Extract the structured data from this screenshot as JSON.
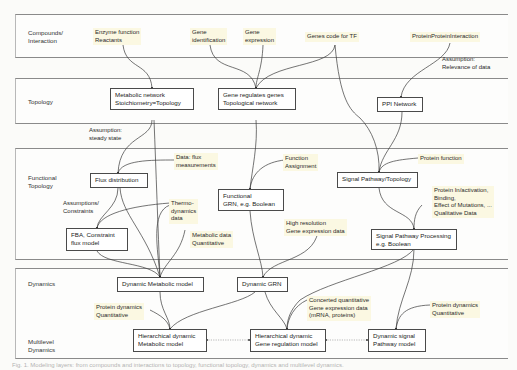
{
  "layers": [
    {
      "id": "compounds",
      "label": "Compounds/\nInteraction"
    },
    {
      "id": "topology",
      "label": "Topology"
    },
    {
      "id": "functional",
      "label": "Functional\nTopology"
    },
    {
      "id": "dynamics",
      "label": "Dynamics"
    },
    {
      "id": "multilevel",
      "label": "Multilevel\nDynamics"
    }
  ],
  "inputs": {
    "enzyme": "Enzyme function\nReactants",
    "gene_identification": "Gene\nidentification",
    "gene_expression": "Gene\nexpression",
    "genes_code_tf": "Genes code for TF",
    "ppi": "ProteinProteinInteraction"
  },
  "nodes": {
    "metabolic_network": "Metabolic network\nStoichiometry=Topology",
    "gene_regulates": "Gene regulates genes\nTopological network",
    "ppi_network": "PPI Network",
    "flux_distribution": "Flux distribution",
    "functional_grn": "Functional\nGRN, e.g. Boolean",
    "signal_topology": "Signal Pathway/Topology",
    "fba": "FBA, Constraint\nflux model",
    "signal_processing": "Signal Pathway Processing\ne.g. Boolean",
    "dynamic_metabolic": "Dynamic Metabolic model",
    "dynamic_grn": "Dynamic GRN",
    "hier_metabolic": "Hierarchical dynamic\nMetabolic model",
    "hier_gene": "Hierarchical dynamic\nGene regulation model",
    "dynamic_signal": "Dynamic signal\nPathway model"
  },
  "annotations": {
    "assumption_relevance": "Assumption:\nRelevance of data",
    "assumption_steady": "Assumption:\nsteady state",
    "data_flux": "Data: flux\nmeasurements",
    "function_assignment": "Function\nAssignment",
    "protein_function": "Protein function",
    "assumptions_constraints": "Assumptions/\nConstraints",
    "thermodynamics": "Thermo-\ndynamics\ndata",
    "protein_activation": "Protein In/activation,\nBinding,\nEffect of Mutations, ...\nQualitative Data",
    "metabolic_data": "Metabolic data\nQuantitative",
    "high_resolution": "High resolution\nGene expression data",
    "protein_dyn_left": "Protein dynamics\nQuantitative",
    "concerted": "Concerted quantitative\nGene expression data\n(mRNA, proteins)",
    "protein_dyn_right": "Protein dynamics\nQuantitative"
  },
  "caption": "Fig. 1. Modeling layers: from compounds and interactions to topology, functional topology, dynamics and multilevel dynamics."
}
